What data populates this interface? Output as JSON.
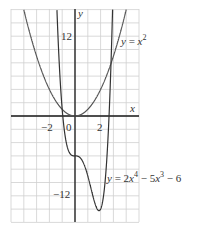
{
  "chart_data": {
    "type": "line",
    "title": "",
    "xlabel": "x",
    "ylabel": "y",
    "xlim": [
      -5,
      5
    ],
    "ylim": [
      -16,
      16
    ],
    "grid": true,
    "x_grid_step": 1,
    "y_grid_step": 2,
    "x_ticks": [
      {
        "value": -2,
        "label": "−2"
      },
      {
        "value": 0,
        "label": "0"
      },
      {
        "value": 2,
        "label": "2"
      }
    ],
    "y_ticks": [
      {
        "value": 12,
        "label": "12"
      },
      {
        "value": -12,
        "label": "−12"
      }
    ],
    "series": [
      {
        "name": "y = x^2",
        "label": "y = x²",
        "expression": "x^2",
        "color": "#555555"
      },
      {
        "name": "y = 2x^4 - 5x^3 - 6",
        "label": "y = 2x⁴ − 5x³ − 6",
        "expression": "2x^4 - 5x^3 - 6",
        "color": "#333333"
      }
    ]
  },
  "labels": {
    "x_axis": "x",
    "y_axis": "y",
    "tick_neg2": "−2",
    "tick_0": "0",
    "tick_2": "2",
    "tick_12": "12",
    "tick_neg12": "−12"
  },
  "colors": {
    "grid": "#cfcfcf",
    "axis": "#1a1a1a",
    "curve": "#444444"
  }
}
